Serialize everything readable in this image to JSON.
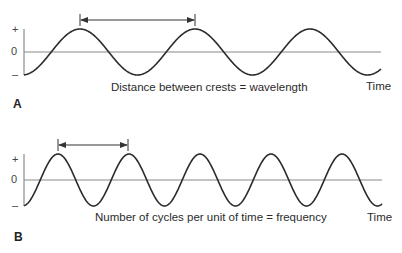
{
  "panels": [
    {
      "id": "A",
      "label": "A",
      "caption": "Distance between crests = wavelength",
      "x_axis_label": "Time",
      "y_ticks": {
        "plus": "+",
        "zero": "0",
        "minus": "–"
      },
      "concept": "wavelength",
      "wave": {
        "x_start": 24,
        "x_end": 381,
        "zero_y": 52,
        "amplitude": 23,
        "period_px": 115,
        "first_crest_x": 80
      },
      "arrow": {
        "x1": 80,
        "x2": 195,
        "y": 20
      }
    },
    {
      "id": "B",
      "label": "B",
      "caption": "Number of cycles per unit of time = frequency",
      "x_axis_label": "Time",
      "y_ticks": {
        "plus": "+",
        "zero": "0",
        "minus": "–"
      },
      "concept": "frequency",
      "wave": {
        "x_start": 24,
        "x_end": 382,
        "zero_y": 180,
        "amplitude": 26,
        "period_px": 71,
        "first_crest_x": 58
      },
      "arrow": {
        "x1": 58,
        "x2": 128,
        "y": 145
      }
    }
  ],
  "colors": {
    "wave": "#2a2a2a",
    "axis": "#777777",
    "text": "#2b2b2b"
  }
}
